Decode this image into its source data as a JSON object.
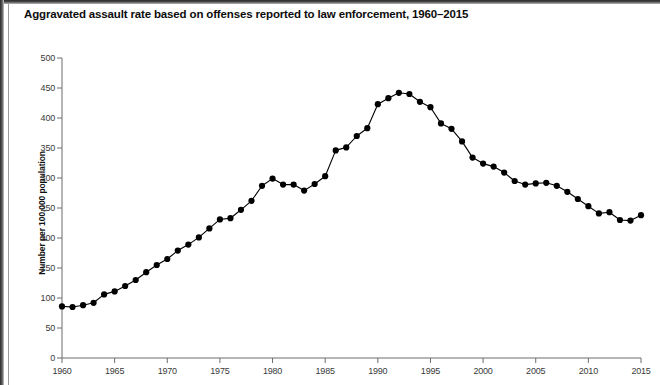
{
  "chart_data": {
    "type": "line",
    "title": "Aggravated assault rate based on offenses reported to law enforcement, 1960–2015",
    "xlabel": "",
    "ylabel": "Number per 100,000 population",
    "xlim": [
      1960,
      2015
    ],
    "ylim": [
      0,
      500
    ],
    "ytick_labels": [
      "0",
      "50",
      "100",
      "150",
      "200",
      "250",
      "300",
      "350",
      "400",
      "450",
      "500"
    ],
    "yticks": [
      0,
      50,
      100,
      150,
      200,
      250,
      300,
      350,
      400,
      450,
      500
    ],
    "xtick_labels": [
      "1960",
      "1965",
      "1970",
      "1975",
      "1980",
      "1985",
      "1990",
      "1995",
      "2000",
      "2005",
      "2010",
      "2015"
    ],
    "xticks": [
      1960,
      1965,
      1970,
      1975,
      1980,
      1985,
      1990,
      1995,
      2000,
      2005,
      2010,
      2015
    ],
    "grid": false,
    "legend": null,
    "marker": "filled-circle",
    "line_color": "#000000",
    "marker_color": "#000000",
    "x": [
      1960,
      1961,
      1962,
      1963,
      1964,
      1965,
      1966,
      1967,
      1968,
      1969,
      1970,
      1971,
      1972,
      1973,
      1974,
      1975,
      1976,
      1977,
      1978,
      1979,
      1980,
      1981,
      1982,
      1983,
      1984,
      1985,
      1986,
      1987,
      1988,
      1989,
      1990,
      1991,
      1992,
      1993,
      1994,
      1995,
      1996,
      1997,
      1998,
      1999,
      2000,
      2001,
      2002,
      2003,
      2004,
      2005,
      2006,
      2007,
      2008,
      2009,
      2010,
      2011,
      2012,
      2013,
      2014,
      2015
    ],
    "values": [
      86,
      85,
      88,
      92,
      106,
      111,
      120,
      130,
      143,
      155,
      165,
      179,
      189,
      201,
      216,
      231,
      233,
      247,
      262,
      287,
      299,
      289,
      289,
      279,
      290,
      303,
      346,
      351,
      370,
      383,
      423,
      433,
      442,
      440,
      427,
      418,
      391,
      382,
      361,
      334,
      324,
      319,
      309,
      295,
      289,
      291,
      292,
      287,
      277,
      265,
      253,
      241,
      243,
      230,
      229,
      238
    ]
  },
  "axis": {
    "y_axis_name": "y-axis",
    "x_axis_name": "x-axis"
  }
}
